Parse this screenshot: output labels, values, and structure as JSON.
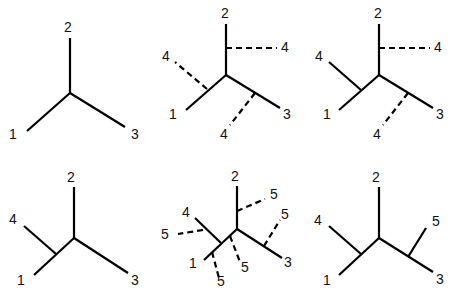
{
  "diagram": {
    "panels": [
      {
        "id": "p1",
        "edges": [
          {
            "x1": 70,
            "y1": 93,
            "x2": 70,
            "y2": 38,
            "style": "solid"
          },
          {
            "x1": 70,
            "y1": 93,
            "x2": 27,
            "y2": 131,
            "style": "solid"
          },
          {
            "x1": 70,
            "y1": 93,
            "x2": 125,
            "y2": 127,
            "style": "solid"
          }
        ],
        "labels": [
          {
            "text": "2",
            "x": 68,
            "y": 28
          },
          {
            "text": "1",
            "x": 13,
            "y": 135
          },
          {
            "text": "3",
            "x": 135,
            "y": 135
          }
        ]
      },
      {
        "id": "p2",
        "edges": [
          {
            "x1": 226,
            "y1": 75,
            "x2": 226,
            "y2": 24,
            "style": "solid"
          },
          {
            "x1": 226,
            "y1": 75,
            "x2": 186,
            "y2": 110,
            "style": "solid"
          },
          {
            "x1": 226,
            "y1": 75,
            "x2": 280,
            "y2": 108,
            "style": "solid"
          },
          {
            "x1": 226,
            "y1": 48,
            "x2": 277,
            "y2": 48,
            "style": "dashed"
          },
          {
            "x1": 207,
            "y1": 89,
            "x2": 175,
            "y2": 62,
            "style": "dashed"
          },
          {
            "x1": 255,
            "y1": 93,
            "x2": 230,
            "y2": 125,
            "style": "dashed"
          }
        ],
        "labels": [
          {
            "text": "2",
            "x": 225,
            "y": 14
          },
          {
            "text": "4",
            "x": 285,
            "y": 48
          },
          {
            "text": "4",
            "x": 166,
            "y": 57
          },
          {
            "text": "1",
            "x": 173,
            "y": 115
          },
          {
            "text": "3",
            "x": 287,
            "y": 115
          },
          {
            "text": "4",
            "x": 224,
            "y": 135
          }
        ]
      },
      {
        "id": "p3",
        "edges": [
          {
            "x1": 379,
            "y1": 75,
            "x2": 379,
            "y2": 24,
            "style": "solid"
          },
          {
            "x1": 379,
            "y1": 75,
            "x2": 339,
            "y2": 110,
            "style": "solid"
          },
          {
            "x1": 379,
            "y1": 75,
            "x2": 433,
            "y2": 108,
            "style": "solid"
          },
          {
            "x1": 361,
            "y1": 90,
            "x2": 329,
            "y2": 62,
            "style": "solid"
          },
          {
            "x1": 379,
            "y1": 48,
            "x2": 430,
            "y2": 48,
            "style": "dashed"
          },
          {
            "x1": 408,
            "y1": 93,
            "x2": 383,
            "y2": 125,
            "style": "dashed"
          }
        ],
        "labels": [
          {
            "text": "2",
            "x": 378,
            "y": 14
          },
          {
            "text": "4",
            "x": 438,
            "y": 48
          },
          {
            "text": "4",
            "x": 319,
            "y": 57
          },
          {
            "text": "1",
            "x": 327,
            "y": 115
          },
          {
            "text": "3",
            "x": 440,
            "y": 115
          },
          {
            "text": "4",
            "x": 377,
            "y": 135
          }
        ]
      },
      {
        "id": "p4",
        "edges": [
          {
            "x1": 74,
            "y1": 238,
            "x2": 74,
            "y2": 187,
            "style": "solid"
          },
          {
            "x1": 74,
            "y1": 238,
            "x2": 34,
            "y2": 275,
            "style": "solid"
          },
          {
            "x1": 74,
            "y1": 238,
            "x2": 128,
            "y2": 273,
            "style": "solid"
          },
          {
            "x1": 56,
            "y1": 254,
            "x2": 24,
            "y2": 226,
            "style": "solid"
          }
        ],
        "labels": [
          {
            "text": "2",
            "x": 71,
            "y": 178
          },
          {
            "text": "4",
            "x": 13,
            "y": 220
          },
          {
            "text": "1",
            "x": 21,
            "y": 281
          },
          {
            "text": "3",
            "x": 135,
            "y": 281
          }
        ]
      },
      {
        "id": "p5",
        "edges": [
          {
            "x1": 237,
            "y1": 229,
            "x2": 237,
            "y2": 186,
            "style": "solid"
          },
          {
            "x1": 237,
            "y1": 229,
            "x2": 204,
            "y2": 260,
            "style": "solid"
          },
          {
            "x1": 237,
            "y1": 229,
            "x2": 282,
            "y2": 258,
            "style": "solid"
          },
          {
            "x1": 221,
            "y1": 243,
            "x2": 195,
            "y2": 218,
            "style": "solid"
          },
          {
            "x1": 237,
            "y1": 211,
            "x2": 265,
            "y2": 199,
            "style": "dashed"
          },
          {
            "x1": 264,
            "y1": 246,
            "x2": 280,
            "y2": 220,
            "style": "dashed"
          },
          {
            "x1": 203,
            "y1": 230,
            "x2": 178,
            "y2": 234,
            "style": "dashed"
          },
          {
            "x1": 230,
            "y1": 236,
            "x2": 240,
            "y2": 262,
            "style": "dashed"
          },
          {
            "x1": 212,
            "y1": 252,
            "x2": 219,
            "y2": 278,
            "style": "dashed"
          }
        ],
        "labels": [
          {
            "text": "2",
            "x": 235,
            "y": 177
          },
          {
            "text": "5",
            "x": 274,
            "y": 195
          },
          {
            "text": "5",
            "x": 285,
            "y": 215
          },
          {
            "text": "4",
            "x": 186,
            "y": 213
          },
          {
            "text": "5",
            "x": 165,
            "y": 235
          },
          {
            "text": "1",
            "x": 193,
            "y": 264
          },
          {
            "text": "5",
            "x": 245,
            "y": 268
          },
          {
            "text": "5",
            "x": 221,
            "y": 282
          },
          {
            "text": "3",
            "x": 288,
            "y": 263
          }
        ]
      },
      {
        "id": "p6",
        "edges": [
          {
            "x1": 379,
            "y1": 238,
            "x2": 379,
            "y2": 187,
            "style": "solid"
          },
          {
            "x1": 379,
            "y1": 238,
            "x2": 339,
            "y2": 275,
            "style": "solid"
          },
          {
            "x1": 379,
            "y1": 238,
            "x2": 433,
            "y2": 272,
            "style": "solid"
          },
          {
            "x1": 361,
            "y1": 254,
            "x2": 329,
            "y2": 226,
            "style": "solid"
          },
          {
            "x1": 408,
            "y1": 257,
            "x2": 426,
            "y2": 228,
            "style": "solid"
          }
        ],
        "labels": [
          {
            "text": "2",
            "x": 376,
            "y": 178
          },
          {
            "text": "4",
            "x": 318,
            "y": 221
          },
          {
            "text": "5",
            "x": 436,
            "y": 222
          },
          {
            "text": "1",
            "x": 327,
            "y": 281
          },
          {
            "text": "3",
            "x": 440,
            "y": 280
          }
        ]
      }
    ]
  }
}
